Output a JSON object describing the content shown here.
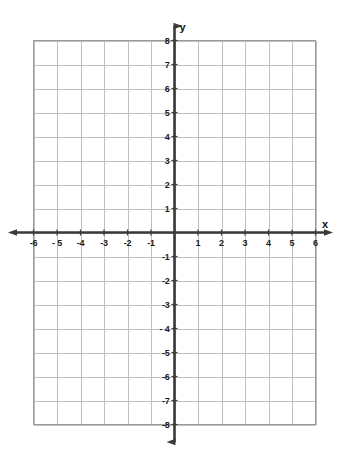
{
  "chart_data": {
    "type": "line",
    "title": "",
    "subtitle": "",
    "xlabel": "x",
    "ylabel": "y",
    "xlim": [
      -6,
      6
    ],
    "ylim": [
      -8,
      8
    ],
    "grid": true,
    "legend": null,
    "series": [],
    "annotations": [],
    "x_ticks": [
      {
        "value": -6,
        "label": "-6"
      },
      {
        "value": -5,
        "label": "- 5"
      },
      {
        "value": -4,
        "label": "-4"
      },
      {
        "value": -3,
        "label": "-3"
      },
      {
        "value": -2,
        "label": "-2"
      },
      {
        "value": -1,
        "label": "-1"
      },
      {
        "value": 1,
        "label": "1"
      },
      {
        "value": 2,
        "label": "2"
      },
      {
        "value": 3,
        "label": "3"
      },
      {
        "value": 4,
        "label": "4"
      },
      {
        "value": 5,
        "label": "5"
      },
      {
        "value": 6,
        "label": "6"
      }
    ],
    "y_ticks": [
      {
        "value": 8,
        "label": "8"
      },
      {
        "value": 7,
        "label": "7"
      },
      {
        "value": 6,
        "label": "6"
      },
      {
        "value": 5,
        "label": "5"
      },
      {
        "value": 4,
        "label": "4"
      },
      {
        "value": 3,
        "label": "3"
      },
      {
        "value": 2,
        "label": "2"
      },
      {
        "value": 1,
        "label": "1"
      },
      {
        "value": -1,
        "label": "-1"
      },
      {
        "value": -2,
        "label": "-2"
      },
      {
        "value": -3,
        "label": "-3"
      },
      {
        "value": -4,
        "label": "- 4"
      },
      {
        "value": -5,
        "label": "-5"
      },
      {
        "value": -6,
        "label": "-6"
      },
      {
        "value": -7,
        "label": "-7"
      },
      {
        "value": -8,
        "label": "-8"
      }
    ],
    "x_major_step": 1,
    "y_major_step": 1,
    "axis_style": {
      "arrows": [
        "left",
        "right",
        "up",
        "down"
      ],
      "axis_color": "#3a3a3a",
      "grid_color": "#bfbfbf",
      "border_color": "#9a9a9a",
      "label_color": "#1c1c1c",
      "background": "#ffffff"
    }
  },
  "labels": {
    "x_axis_name": "x",
    "y_axis_name": "y"
  }
}
